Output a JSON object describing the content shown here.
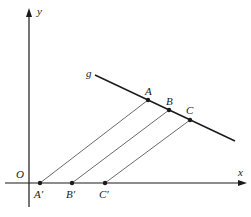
{
  "diagram": {
    "type": "parallel-projection",
    "axes": {
      "origin_label": "O",
      "x_label": "x",
      "y_label": "y"
    },
    "line": {
      "label": "g",
      "from": [
        95,
        75
      ],
      "to": [
        235,
        141
      ]
    },
    "points_on_g": [
      {
        "label": "A",
        "pos": [
          148,
          100
        ]
      },
      {
        "label": "B",
        "pos": [
          169,
          110
        ]
      },
      {
        "label": "C",
        "pos": [
          190,
          120
        ]
      }
    ],
    "projected_points": [
      {
        "label": "A′",
        "pos": [
          40,
          183
        ]
      },
      {
        "label": "B′",
        "pos": [
          72,
          183
        ]
      },
      {
        "label": "C′",
        "pos": [
          105,
          183
        ]
      }
    ],
    "colors": {
      "ink": "#1a1a1a",
      "thin_line": "#444444"
    }
  }
}
